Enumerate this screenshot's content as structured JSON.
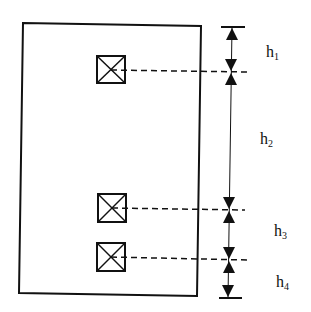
{
  "diagram": {
    "type": "elevation-dimension-diagram",
    "panel": {
      "x": 21,
      "y": 23,
      "width": 180,
      "height": 273,
      "stroke": "#111111"
    },
    "markers": [
      {
        "id": "marker-1",
        "symbol": "boxed-x",
        "x": 97,
        "y": 56,
        "size": 28
      },
      {
        "id": "marker-2",
        "symbol": "boxed-x",
        "x": 97,
        "y": 194,
        "size": 28
      },
      {
        "id": "marker-3",
        "symbol": "boxed-x",
        "x": 97,
        "y": 243,
        "size": 28
      }
    ],
    "dimension_line_x": 230,
    "dimension_levels_y": [
      27,
      72,
      210,
      260,
      298
    ],
    "labels": [
      {
        "id": "h1",
        "base": "h",
        "sub": "1",
        "x": 266,
        "y": 47
      },
      {
        "id": "h2",
        "base": "h",
        "sub": "2",
        "x": 260,
        "y": 133
      },
      {
        "id": "h3",
        "base": "h",
        "sub": "3",
        "x": 273,
        "y": 226
      },
      {
        "id": "h4",
        "base": "h",
        "sub": "4",
        "x": 276,
        "y": 276
      }
    ]
  },
  "text": {
    "h1_base": "h",
    "h1_sub": "1",
    "h2_base": "h",
    "h2_sub": "2",
    "h3_base": "h",
    "h3_sub": "3",
    "h4_base": "h",
    "h4_sub": "4"
  }
}
